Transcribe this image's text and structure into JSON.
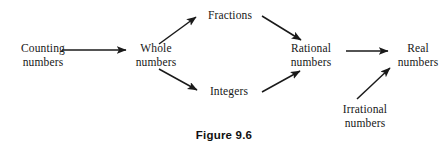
{
  "figure": {
    "caption": "Figure 9.6",
    "stroke_color": "#1a1a1a",
    "text_color": "#171717",
    "background_color": "#ffffff"
  },
  "nodes": {
    "counting": {
      "line1": "Counting",
      "line2": "numbers"
    },
    "whole": {
      "line1": "Whole",
      "line2": "numbers"
    },
    "fractions": {
      "line1": "Fractions",
      "line2": ""
    },
    "integers": {
      "line1": "Integers",
      "line2": ""
    },
    "rational": {
      "line1": "Rational",
      "line2": "numbers"
    },
    "irrational": {
      "line1": "Irrational",
      "line2": "numbers"
    },
    "real": {
      "line1": "Real",
      "line2": "numbers"
    }
  },
  "edges": [
    {
      "id": "counting-to-whole",
      "from": "Counting numbers",
      "to": "Whole numbers",
      "x1": 62,
      "y1": 50,
      "x2": 126,
      "y2": 50
    },
    {
      "id": "whole-to-fractions",
      "from": "Whole numbers",
      "to": "Fractions",
      "x1": 159,
      "y1": 44,
      "x2": 196,
      "y2": 17
    },
    {
      "id": "whole-to-integers",
      "from": "Whole numbers",
      "to": "Integers",
      "x1": 159,
      "y1": 69,
      "x2": 197,
      "y2": 90
    },
    {
      "id": "fractions-to-rational",
      "from": "Fractions",
      "to": "Rational numbers",
      "x1": 262,
      "y1": 16,
      "x2": 301,
      "y2": 40
    },
    {
      "id": "integers-to-rational",
      "from": "Integers",
      "to": "Rational numbers",
      "x1": 262,
      "y1": 92,
      "x2": 300,
      "y2": 71
    },
    {
      "id": "rational-to-real",
      "from": "Rational numbers",
      "to": "Real numbers",
      "x1": 346,
      "y1": 51,
      "x2": 388,
      "y2": 51
    },
    {
      "id": "irrational-to-real",
      "from": "Irrational numbers",
      "to": "Real numbers",
      "x1": 357,
      "y1": 99,
      "x2": 390,
      "y2": 68
    }
  ]
}
